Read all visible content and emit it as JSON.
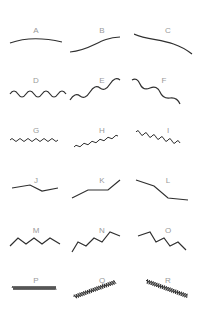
{
  "colors": {
    "stroke": "#2f2f2f",
    "label": "#9a9a9a",
    "background": "#ffffff"
  },
  "items": [
    {
      "label": "A",
      "style": "gentle-curve-flat"
    },
    {
      "label": "B",
      "style": "gentle-curve-rising"
    },
    {
      "label": "C",
      "style": "gentle-curve-falling"
    },
    {
      "label": "D",
      "style": "wave-flat"
    },
    {
      "label": "E",
      "style": "wave-rising"
    },
    {
      "label": "F",
      "style": "wave-falling"
    },
    {
      "label": "G",
      "style": "fine-wave-flat"
    },
    {
      "label": "H",
      "style": "fine-wave-rising"
    },
    {
      "label": "I",
      "style": "fine-wave-falling"
    },
    {
      "label": "J",
      "style": "polyline-flat"
    },
    {
      "label": "K",
      "style": "polyline-rising"
    },
    {
      "label": "L",
      "style": "polyline-falling"
    },
    {
      "label": "M",
      "style": "zigzag-flat"
    },
    {
      "label": "N",
      "style": "zigzag-rising"
    },
    {
      "label": "O",
      "style": "zigzag-falling"
    },
    {
      "label": "P",
      "style": "dense-zigzag-flat"
    },
    {
      "label": "Q",
      "style": "dense-zigzag-rising"
    },
    {
      "label": "R",
      "style": "dense-zigzag-falling"
    }
  ]
}
